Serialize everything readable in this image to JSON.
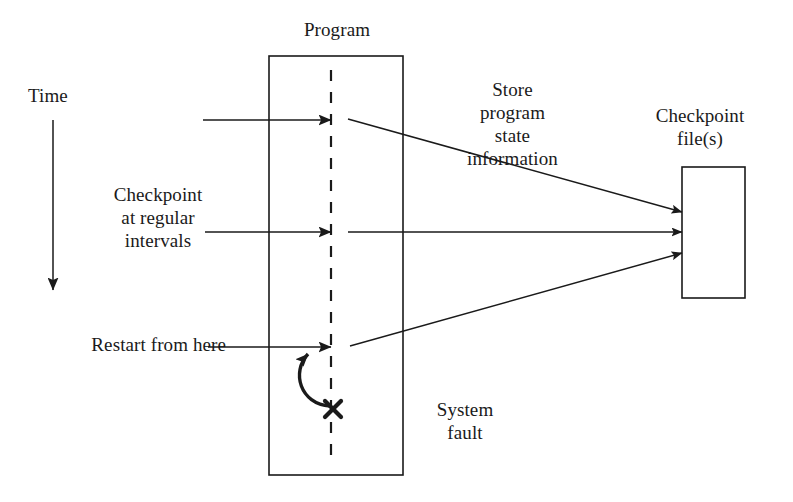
{
  "diagram": {
    "stroke_color": "#1a1a1a",
    "background_color": "#ffffff",
    "labels": {
      "time": "Time",
      "program": "Program",
      "checkpoint_at_regular_intervals": "Checkpoint\nat regular\nintervals",
      "restart_from_here": "Restart from here",
      "store_program_state_information": "Store\nprogram\nstate\ninformation",
      "checkpoint_files": "Checkpoint\nfile(s)",
      "system_fault": "System\nfault"
    },
    "shapes": {
      "program_box": {
        "x": 269,
        "y": 56,
        "width": 134,
        "height": 419
      },
      "checkpoint_file_box": {
        "x": 682,
        "y": 167,
        "width": 63,
        "height": 131
      },
      "execution_timeline_dashed": {
        "x": 331,
        "y1": 70,
        "y2": 466
      },
      "fault_marker_x": {
        "x": 333,
        "y": 409,
        "size": 12
      }
    },
    "arrows": {
      "time_axis": {
        "x": 53,
        "y1": 120,
        "y2": 295,
        "direction": "down"
      },
      "checkpoint_1": {
        "x1": 203,
        "y1": 120,
        "x2": 332,
        "y2": 120
      },
      "checkpoint_2": {
        "x1": 205,
        "y1": 232,
        "x2": 332,
        "y2": 232
      },
      "restart": {
        "x1": 208,
        "y1": 347,
        "x2": 332,
        "y2": 347
      },
      "store_1": {
        "x1": 348,
        "y1": 119,
        "x2": 682,
        "y2": 212
      },
      "store_2": {
        "x1": 348,
        "y1": 232,
        "x2": 682,
        "y2": 232
      },
      "store_3": {
        "x1": 350,
        "y1": 346,
        "x2": 682,
        "y2": 253
      },
      "rollback_curve": {
        "from_x": 333,
        "from_y": 405,
        "to_x": 331,
        "to_y": 350
      }
    }
  }
}
